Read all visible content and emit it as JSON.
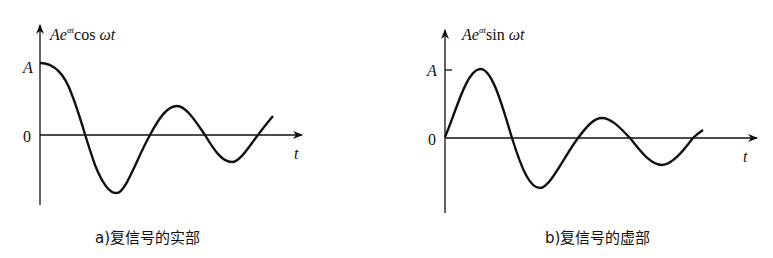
{
  "panels": [
    {
      "id": "a",
      "ylabel_main": "Ae",
      "ylabel_sup": "αt",
      "ylabel_func": "cos ",
      "ylabel_arg": "ωt",
      "y_tick_A": "A",
      "y_tick_0": "0",
      "xlabel": "t",
      "caption": "a)复信号的实部"
    },
    {
      "id": "b",
      "ylabel_main": "Ae",
      "ylabel_sup": "αt",
      "ylabel_func": "sin ",
      "ylabel_arg": "ωt",
      "y_tick_A": "A",
      "y_tick_0": "0",
      "xlabel": "t",
      "caption": "b)复信号的虚部"
    }
  ],
  "colors": {
    "stroke": "#111111",
    "background": "#ffffff"
  }
}
